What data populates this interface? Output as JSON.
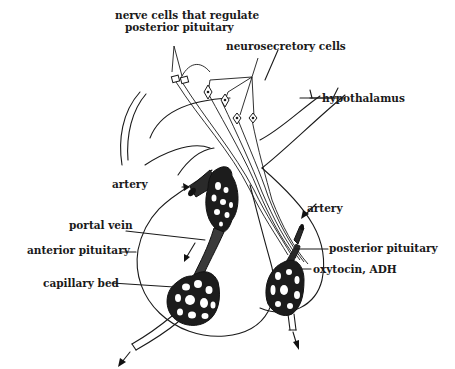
{
  "diagram": {
    "type": "anatomical illustration",
    "labels": {
      "nerve_cells_line1": "nerve cells that regulate",
      "nerve_cells_line2": "posterior pituitary",
      "neurosecretory_cells": "neurosecretory cells",
      "hypothalamus": "hypothalamus",
      "artery_left": "artery",
      "portal_vein": "portal vein",
      "anterior_pituitary": "anterior pituitary",
      "capillary_bed": "capillary bed",
      "artery_right": "artery",
      "posterior_pituitary": "posterior pituitary",
      "oxytocin_adh": "oxytocin, ADH"
    },
    "colors": {
      "ink": "#1a1a1a",
      "background": "#ffffff"
    }
  }
}
